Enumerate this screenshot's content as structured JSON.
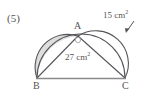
{
  "figure": {
    "problem_number": "(5)",
    "vertices": {
      "apex": "A",
      "bottom_left": "B",
      "bottom_right": "C"
    },
    "labels": {
      "triangle_area_value": "27 cm",
      "triangle_area_exponent": "2",
      "lune_area_value": "15 cm",
      "lune_area_exponent": "2"
    },
    "colors": {
      "stroke": "#55555a",
      "shade": "#dedede",
      "background": "#ffffff",
      "text": "#555555"
    },
    "geometry": {
      "B": [
        37,
        78
      ],
      "C": [
        125,
        78
      ],
      "A": [
        78,
        36
      ],
      "semicircle_BC": "diameter BC bulging upward",
      "semicircle_AB": "diameter AB bulging up-left, shaded",
      "semicircle_AC": "diameter AC bulging up-right, unshaded"
    },
    "annotation_arrow": {
      "name": "leader-arrow",
      "from": [
        134,
        22
      ],
      "to": [
        126,
        33
      ]
    }
  }
}
